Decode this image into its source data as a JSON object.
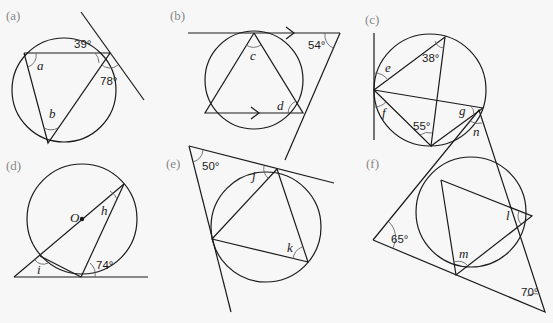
{
  "diagrams": {
    "a": {
      "label": "(a)",
      "given": [
        "39°",
        "78°"
      ],
      "unknowns": [
        "a",
        "b"
      ]
    },
    "b": {
      "label": "(b)",
      "given": [
        "54°"
      ],
      "unknowns": [
        "c",
        "d"
      ]
    },
    "c": {
      "label": "(c)",
      "given": [
        "38°",
        "55°"
      ],
      "unknowns": [
        "e",
        "f",
        "g"
      ]
    },
    "d": {
      "label": "(d)",
      "given": [
        "74°"
      ],
      "unknowns": [
        "h",
        "i"
      ],
      "center_label": "O"
    },
    "e": {
      "label": "(e)",
      "given": [
        "50°"
      ],
      "unknowns": [
        "j",
        "k"
      ]
    },
    "f": {
      "label": "(f)",
      "given": [
        "65°",
        "70°"
      ],
      "unknowns": [
        "l",
        "m",
        "n"
      ]
    }
  }
}
